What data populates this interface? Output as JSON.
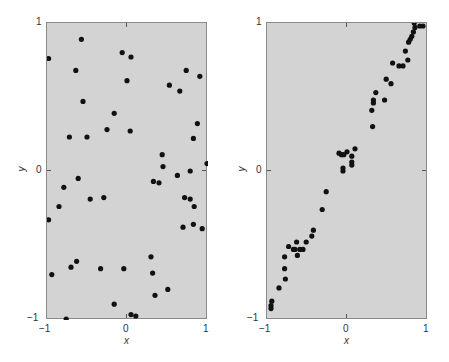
{
  "chart_data": [
    {
      "type": "scatter",
      "title": "",
      "xlabel": "x",
      "ylabel": "y",
      "xlim": [
        -1,
        1
      ],
      "ylim": [
        -1,
        1
      ],
      "grid": false,
      "xticks": [
        "-1",
        "0",
        "1"
      ],
      "yticks": [
        "-1",
        "0",
        "1"
      ],
      "points": [
        [
          -0.98,
          0.76
        ],
        [
          -0.57,
          0.89
        ],
        [
          -0.64,
          0.68
        ],
        [
          -0.55,
          0.47
        ],
        [
          -0.16,
          0.39
        ],
        [
          -0.25,
          0.28
        ],
        [
          0.04,
          0.27
        ],
        [
          -0.72,
          0.23
        ],
        [
          -0.5,
          0.23
        ],
        [
          -0.06,
          0.8
        ],
        [
          0.05,
          0.77
        ],
        [
          0.0,
          0.61
        ],
        [
          0.53,
          0.58
        ],
        [
          0.66,
          0.54
        ],
        [
          0.74,
          0.68
        ],
        [
          0.91,
          0.64
        ],
        [
          0.88,
          0.32
        ],
        [
          0.83,
          0.22
        ],
        [
          0.44,
          0.11
        ],
        [
          0.45,
          0.03
        ],
        [
          0.63,
          -0.03
        ],
        [
          0.79,
          0.0
        ],
        [
          1.0,
          0.05
        ],
        [
          -0.61,
          -0.05
        ],
        [
          0.33,
          -0.07
        ],
        [
          0.4,
          -0.08
        ],
        [
          -0.29,
          -0.18
        ],
        [
          -0.79,
          -0.11
        ],
        [
          -0.85,
          -0.24
        ],
        [
          -0.98,
          -0.33
        ],
        [
          -0.46,
          -0.19
        ],
        [
          0.72,
          -0.18
        ],
        [
          0.79,
          -0.19
        ],
        [
          0.84,
          -0.24
        ],
        [
          0.7,
          -0.38
        ],
        [
          0.83,
          -0.36
        ],
        [
          0.94,
          -0.39
        ],
        [
          -0.94,
          -0.7
        ],
        [
          -0.7,
          -0.65
        ],
        [
          -0.63,
          -0.61
        ],
        [
          -0.33,
          -0.66
        ],
        [
          -0.04,
          -0.66
        ],
        [
          0.3,
          -0.58
        ],
        [
          0.32,
          -0.69
        ],
        [
          0.51,
          -0.8
        ],
        [
          0.35,
          -0.84
        ],
        [
          -0.16,
          -0.9
        ],
        [
          0.05,
          -0.97
        ],
        [
          0.11,
          -0.98
        ],
        [
          -0.76,
          -1.0
        ]
      ],
      "correlation": "none"
    },
    {
      "type": "scatter",
      "title": "",
      "xlabel": "x",
      "ylabel": "y",
      "xlim": [
        -1,
        1
      ],
      "ylim": [
        -1,
        1
      ],
      "grid": false,
      "xticks": [
        "-1",
        "0",
        "1"
      ],
      "yticks": [
        "-1",
        "0",
        "1"
      ],
      "points": [
        [
          0.84,
          1.0
        ],
        [
          0.85,
          0.97
        ],
        [
          0.91,
          0.98
        ],
        [
          0.95,
          0.98
        ],
        [
          0.83,
          0.94
        ],
        [
          0.81,
          0.91
        ],
        [
          0.79,
          0.89
        ],
        [
          0.77,
          0.87
        ],
        [
          0.73,
          0.81
        ],
        [
          0.76,
          0.75
        ],
        [
          0.57,
          0.73
        ],
        [
          0.65,
          0.71
        ],
        [
          0.7,
          0.71
        ],
        [
          0.49,
          0.62
        ],
        [
          0.55,
          0.59
        ],
        [
          0.36,
          0.53
        ],
        [
          0.33,
          0.48
        ],
        [
          0.33,
          0.46
        ],
        [
          0.47,
          0.48
        ],
        [
          0.31,
          0.41
        ],
        [
          0.32,
          0.3
        ],
        [
          0.1,
          0.15
        ],
        [
          0.0,
          0.13
        ],
        [
          -0.04,
          0.11
        ],
        [
          -0.07,
          0.11
        ],
        [
          -0.1,
          0.12
        ],
        [
          0.06,
          0.1
        ],
        [
          0.06,
          0.06
        ],
        [
          0.06,
          0.04
        ],
        [
          -0.05,
          0.02
        ],
        [
          -0.05,
          0.0
        ],
        [
          -0.26,
          -0.14
        ],
        [
          -0.31,
          -0.26
        ],
        [
          -0.42,
          -0.4
        ],
        [
          -0.44,
          -0.44
        ],
        [
          -0.51,
          -0.48
        ],
        [
          -0.63,
          -0.48
        ],
        [
          -0.55,
          -0.53
        ],
        [
          -0.59,
          -0.53
        ],
        [
          -0.67,
          -0.53
        ],
        [
          -0.73,
          -0.51
        ],
        [
          -0.62,
          -0.57
        ],
        [
          -0.65,
          -0.53
        ],
        [
          -0.78,
          -0.58
        ],
        [
          -0.78,
          -0.66
        ],
        [
          -0.77,
          -0.73
        ],
        [
          -0.85,
          -0.79
        ],
        [
          -0.94,
          -0.88
        ],
        [
          -0.95,
          -0.91
        ],
        [
          -0.95,
          -0.93
        ]
      ],
      "correlation": "strong positive"
    }
  ],
  "panels": [
    {
      "xlabel": "x",
      "ylabel": "y",
      "xticks": [
        "−1",
        "0",
        "1"
      ],
      "yticks": [
        "1",
        "0",
        "−1"
      ]
    },
    {
      "xlabel": "x",
      "ylabel": "y",
      "xticks": [
        "−1",
        "0",
        "1"
      ],
      "yticks": [
        "1",
        "0",
        "−1"
      ]
    }
  ]
}
